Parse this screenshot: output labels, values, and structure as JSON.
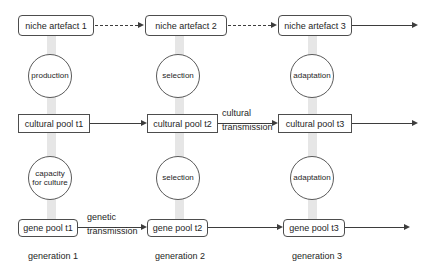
{
  "diagram_title": "gene-culture niche construction diagram",
  "columns": [
    {
      "generation": "generation 1",
      "niche_artefact": "niche artefact 1",
      "upper_process": "production",
      "cultural_pool": "cultural pool t1",
      "lower_process_lines": [
        "capacity",
        "for culture"
      ],
      "gene_pool": "gene pool t1"
    },
    {
      "generation": "generation 2",
      "niche_artefact": "niche artefact 2",
      "upper_process": "selection",
      "cultural_pool": "cultural pool t2",
      "lower_process_lines": [
        "selection"
      ],
      "gene_pool": "gene pool t2"
    },
    {
      "generation": "generation 3",
      "niche_artefact": "niche artefact 3",
      "upper_process": "adaptation",
      "cultural_pool": "cultural pool t3",
      "lower_process_lines": [
        "adaptation"
      ],
      "gene_pool": "gene pool t3"
    }
  ],
  "edge_labels": {
    "cultural_transmission": [
      "cultural",
      "transmission"
    ],
    "genetic_transmission": [
      "genetic",
      "transmission"
    ]
  },
  "colors": {
    "line": "#3d3d3d",
    "box_border": "#4d4d4d",
    "circle_border": "#5a5a5a",
    "text": "#262626",
    "column_bar": "#e6e6e6",
    "background": "#ffffff"
  }
}
